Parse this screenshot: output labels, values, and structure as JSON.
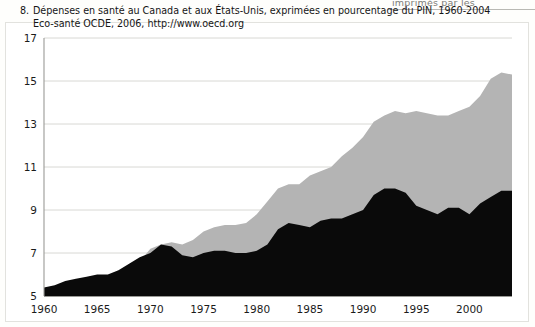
{
  "page": {
    "clipped_top_text": "imprimés par les"
  },
  "caption": {
    "number": "8.",
    "line1": "Dépenses en santé au Canada et aux États-Unis, exprimées en pourcentage du PIN, 1960-2004",
    "line2": "Eco-santé OCDE, 2006, http://www.oecd.org"
  },
  "colors": {
    "canada_area": "#0a0a0a",
    "usa_area": "#b4b4b4",
    "gridline": "#d8d8d4",
    "axis": "#9a9a96",
    "text": "#151515",
    "page_background": "#ffffff"
  },
  "chart_data": {
    "type": "area",
    "title": "Dépenses en santé au Canada et aux États-Unis, exprimées en pourcentage du PIN, 1960-2004",
    "subtitle": "Eco-santé OCDE, 2006, http://www.oecd.org",
    "xlabel": "",
    "ylabel": "",
    "xlim": [
      1960,
      2004
    ],
    "ylim": [
      5,
      17
    ],
    "yticks": [
      5,
      7,
      9,
      11,
      13,
      15,
      17
    ],
    "xticks": [
      1960,
      1965,
      1970,
      1975,
      1980,
      1985,
      1990,
      1995,
      2000
    ],
    "grid": "horizontal",
    "legend": "none",
    "stacked": false,
    "note": "Two overlapping filled areas drawn from the y=5 baseline; the gray (United States) area is the larger envelope and the black (Canada) area is drawn on top of it.",
    "x": [
      1960,
      1961,
      1962,
      1963,
      1964,
      1965,
      1966,
      1967,
      1968,
      1969,
      1970,
      1971,
      1972,
      1973,
      1974,
      1975,
      1976,
      1977,
      1978,
      1979,
      1980,
      1981,
      1982,
      1983,
      1984,
      1985,
      1986,
      1987,
      1988,
      1989,
      1990,
      1991,
      1992,
      1993,
      1994,
      1995,
      1996,
      1997,
      1998,
      1999,
      2000,
      2001,
      2002,
      2003,
      2004
    ],
    "series": [
      {
        "name": "États-Unis",
        "color": "#b4b4b4",
        "values": [
          5.2,
          5.3,
          5.4,
          5.5,
          5.6,
          5.7,
          5.8,
          6.1,
          6.3,
          6.6,
          7.2,
          7.4,
          7.5,
          7.4,
          7.6,
          8.0,
          8.2,
          8.3,
          8.3,
          8.4,
          8.8,
          9.4,
          10.0,
          10.2,
          10.2,
          10.6,
          10.8,
          11.0,
          11.5,
          11.9,
          12.4,
          13.1,
          13.4,
          13.6,
          13.5,
          13.6,
          13.5,
          13.4,
          13.4,
          13.6,
          13.8,
          14.3,
          15.1,
          15.4,
          15.3
        ]
      },
      {
        "name": "Canada",
        "color": "#0a0a0a",
        "values": [
          5.4,
          5.5,
          5.7,
          5.8,
          5.9,
          6.0,
          6.0,
          6.2,
          6.5,
          6.8,
          7.0,
          7.4,
          7.3,
          6.9,
          6.8,
          7.0,
          7.1,
          7.1,
          7.0,
          7.0,
          7.1,
          7.4,
          8.1,
          8.4,
          8.3,
          8.2,
          8.5,
          8.6,
          8.6,
          8.8,
          9.0,
          9.7,
          10.0,
          10.0,
          9.8,
          9.2,
          9.0,
          8.8,
          9.1,
          9.1,
          8.8,
          9.3,
          9.6,
          9.9,
          9.9
        ]
      }
    ]
  }
}
